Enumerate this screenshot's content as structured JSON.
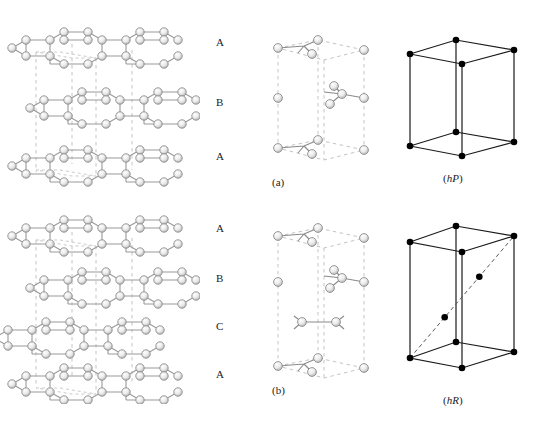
{
  "figure": {
    "type": "crystal-structure-diagram",
    "rows": [
      {
        "id": "a",
        "sublabel": "(a)",
        "stacking": "ABA",
        "layer_labels": [
          "A",
          "B",
          "A"
        ],
        "lattice_label_prefix": "(",
        "lattice_label_italic": "h",
        "lattice_label_roman": "P",
        "lattice_label_suffix": ")",
        "lattice_label": "(hP)",
        "lattice_type": "hexagonal primitive",
        "lattice_points": 8,
        "has_body_diagonal": false
      },
      {
        "id": "b",
        "sublabel": "(b)",
        "stacking": "ABCA",
        "layer_labels": [
          "A",
          "B",
          "C",
          "A"
        ],
        "lattice_label_prefix": "(",
        "lattice_label_italic": "h",
        "lattice_label_roman": "R",
        "lattice_label_suffix": ")",
        "lattice_label": "(hR)",
        "lattice_type": "rhombohedral",
        "lattice_points": 10,
        "has_body_diagonal": true
      }
    ],
    "colors": {
      "atom_fill": "#e8e8e8",
      "atom_stroke": "#8c8c8c",
      "atom_highlight": "#fcfcfc",
      "bond": "#9a9a9a",
      "cell_dashed": "#bdbdbd",
      "lattice_line": "#1a1a1a",
      "lattice_point": "#000000",
      "text": "#222222",
      "background": "#ffffff"
    },
    "caption_text": ""
  }
}
